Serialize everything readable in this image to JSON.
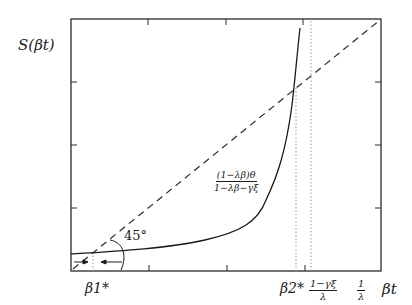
{
  "diagram": {
    "type": "phase-diagram",
    "y_axis_label": "S(βt)",
    "x_axis_label": "βt",
    "x_tick_labels": {
      "beta1_star": "β1*",
      "beta2_star": "β2*",
      "one_minus_gamma_xi_over_lambda": {
        "num": "1−γξ",
        "den": "λ"
      },
      "one_over_lambda": {
        "num": "1",
        "den": "λ"
      }
    },
    "curve_label": {
      "num": "(1−λβ)θ",
      "den": "1−λβ−γξ"
    },
    "angle_label": "45°",
    "elements": [
      {
        "name": "45-degree line",
        "style": "dashed"
      },
      {
        "name": "S(β) curve",
        "style": "solid"
      },
      {
        "name": "β1* marker",
        "style": "dotted vertical"
      },
      {
        "name": "β2* marker",
        "style": "dotted vertical"
      },
      {
        "name": "(1−γξ)/λ marker",
        "style": "dotted vertical"
      }
    ],
    "arrows": [
      {
        "direction": "right",
        "position": "left of β1*"
      },
      {
        "direction": "left",
        "position": "right of β1*"
      }
    ],
    "colors": {
      "ink": "#1a1a1a",
      "dotted": "#9a9a9a",
      "background": "#ffffff"
    }
  }
}
